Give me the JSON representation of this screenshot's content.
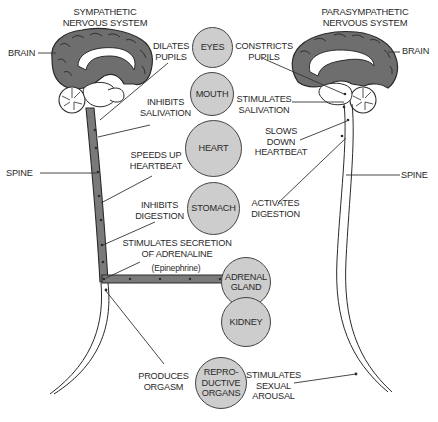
{
  "sympathetic": {
    "title": "SYMPATHETIC\nNERVOUS SYSTEM",
    "brain_label": "BRAIN",
    "spine_label": "SPINE",
    "effects": [
      {
        "id": "eyes",
        "text": "DILATES\nPUPILS"
      },
      {
        "id": "mouth",
        "text": "INHIBITS\nSALIVATION"
      },
      {
        "id": "heart",
        "text": "SPEEDS UP\nHEARTBEAT"
      },
      {
        "id": "stomach",
        "text": "INHIBITS\nDIGESTION"
      },
      {
        "id": "adrenal",
        "text": "STIMULATES SECRETION\nOF ADRENALINE",
        "subtext": "(Epinephrine)"
      },
      {
        "id": "reproductive",
        "text": "PRODUCES\nORGASM"
      }
    ]
  },
  "parasympathetic": {
    "title": "PARASYMPATHETIC\nNERVOUS SYSTEM",
    "brain_label": "BRAIN",
    "spine_label": "SPINE",
    "effects": [
      {
        "id": "eyes",
        "text": "CONSTRICTS\nPUPILS"
      },
      {
        "id": "mouth",
        "text": "STIMULATES\nSALIVATION"
      },
      {
        "id": "heart",
        "text": "SLOWS\nDOWN\nHEARTBEAT"
      },
      {
        "id": "stomach",
        "text": "ACTIVATES\nDIGESTION"
      },
      {
        "id": "reproductive",
        "text": "STIMULATES\nSEXUAL\nAROUSAL"
      }
    ]
  },
  "organs": [
    {
      "id": "eyes",
      "label": "EYES"
    },
    {
      "id": "mouth",
      "label": "MOUTH"
    },
    {
      "id": "heart",
      "label": "HEART"
    },
    {
      "id": "stomach",
      "label": "STOMACH"
    },
    {
      "id": "adrenal",
      "label": "ADRENAL\nGLAND"
    },
    {
      "id": "kidney",
      "label": "KIDNEY"
    },
    {
      "id": "reproductive",
      "label": "REPRO-\nDUCTIVE\nORGANS"
    }
  ],
  "colors": {
    "brain_fill": "#6e6e6e",
    "organ_fill": "#cdcdcd",
    "sympathetic_spine_fill": "#7a7a7a",
    "line": "#333333"
  }
}
